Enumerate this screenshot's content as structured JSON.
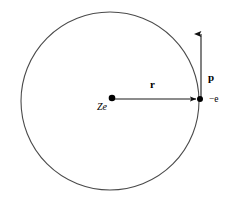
{
  "figure": {
    "type": "physics-diagram",
    "background_color": "#ffffff",
    "stroke_color": "#3a3a3a",
    "ink_color": "#000000",
    "canvas": {
      "width": 232,
      "height": 204
    },
    "orbit": {
      "name": "circular-orbit",
      "center_x": 110,
      "center_y": 101,
      "radius": 89,
      "stroke_width": 1
    },
    "nucleus": {
      "name": "nucleus",
      "x": 112,
      "y": 98,
      "dot_radius": 3.2,
      "label": "Ze"
    },
    "electron": {
      "name": "electron",
      "x": 200,
      "y": 99,
      "dot_radius": 3,
      "label": "−e"
    },
    "radius_vector": {
      "name": "radius-vector",
      "label": "r",
      "from_x": 112,
      "from_y": 99,
      "to_x": 199,
      "to_y": 99
    },
    "momentum_vector": {
      "name": "momentum-vector",
      "label": "p",
      "from_x": 201,
      "from_y": 100,
      "to_x": 201,
      "to_y": 30
    }
  }
}
